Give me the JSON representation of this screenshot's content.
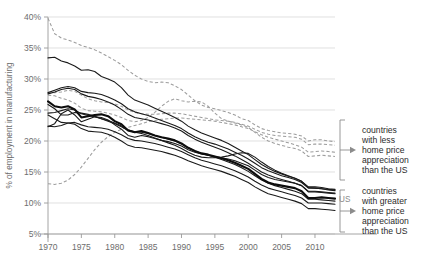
{
  "chart_data": {
    "type": "line",
    "title": "",
    "xlabel": "",
    "ylabel": "% of employment in manufacturing",
    "xlim": [
      1970,
      2013
    ],
    "ylim": [
      5,
      40
    ],
    "grid": true,
    "legend_position": "right-annotations",
    "x_ticks": [
      "1970",
      "1975",
      "1980",
      "1985",
      "1990",
      "1995",
      "2000",
      "2005",
      "2010"
    ],
    "x_tick_values": [
      1970,
      1975,
      1980,
      1985,
      1990,
      1995,
      2000,
      2005,
      2010
    ],
    "y_ticks": [
      "5%",
      "10%",
      "15%",
      "20%",
      "25%",
      "30%",
      "35%",
      "40%"
    ],
    "y_tick_values": [
      5,
      10,
      15,
      20,
      25,
      30,
      35,
      40
    ],
    "x": [
      1970,
      1971,
      1972,
      1973,
      1974,
      1975,
      1976,
      1977,
      1978,
      1979,
      1980,
      1981,
      1982,
      1983,
      1984,
      1985,
      1986,
      1987,
      1988,
      1989,
      1990,
      1991,
      1992,
      1993,
      1994,
      1995,
      1996,
      1997,
      1998,
      1999,
      2000,
      2001,
      2002,
      2003,
      2004,
      2005,
      2006,
      2007,
      2008,
      2009,
      2010,
      2011,
      2012,
      2013
    ],
    "series": [
      {
        "name": "dashed-1",
        "style": "dashed",
        "group": "less_appreciation",
        "values": [
          39.8,
          37.3,
          36.6,
          36.3,
          35.9,
          35.4,
          35.1,
          34.7,
          34.2,
          33.6,
          33.0,
          32.3,
          31.4,
          30.6,
          30.0,
          29.6,
          29.4,
          29.5,
          29.4,
          28.9,
          28.3,
          27.4,
          26.5,
          25.8,
          25.4,
          25.2,
          24.9,
          24.6,
          24.2,
          23.6,
          23.3,
          22.6,
          22.0,
          21.7,
          21.5,
          21.3,
          21.2,
          21.1,
          20.8,
          20.0,
          20.2,
          20.2,
          20.0,
          19.9
        ]
      },
      {
        "name": "dashed-2",
        "style": "dashed",
        "group": "less_appreciation",
        "values": [
          27.7,
          27.8,
          27.9,
          28.2,
          28.0,
          27.4,
          26.8,
          26.5,
          26.3,
          26.2,
          26.0,
          25.6,
          25.0,
          24.6,
          24.4,
          24.3,
          24.3,
          24.4,
          24.5,
          24.5,
          24.4,
          24.2,
          24.0,
          23.8,
          23.6,
          23.4,
          23.3,
          23.2,
          23.0,
          22.7,
          22.4,
          21.9,
          21.4,
          21.1,
          20.9,
          20.8,
          20.7,
          20.6,
          20.3,
          19.4,
          19.5,
          19.5,
          19.4,
          19.3
        ]
      },
      {
        "name": "dashed-3",
        "style": "dashed",
        "group": "less_appreciation",
        "values": [
          27.4,
          27.3,
          26.9,
          26.6,
          26.1,
          25.3,
          24.9,
          24.8,
          24.7,
          24.5,
          24.2,
          23.8,
          23.3,
          23.1,
          23.3,
          23.8,
          24.6,
          25.6,
          26.4,
          26.8,
          26.5,
          26.3,
          26.4,
          26.3,
          25.6,
          24.5,
          23.6,
          23.2,
          22.9,
          22.6,
          22.2,
          21.4,
          20.6,
          20.0,
          19.6,
          19.3,
          19.0,
          18.8,
          18.4,
          17.5,
          17.6,
          17.7,
          17.6,
          17.5
        ]
      },
      {
        "name": "dashed-4",
        "style": "dashed",
        "group": "less_appreciation",
        "values": [
          13.1,
          13.0,
          13.2,
          13.7,
          14.6,
          15.8,
          17.2,
          18.6,
          19.8,
          20.7,
          21.4,
          21.9,
          22.2,
          22.5,
          22.8,
          23.1,
          23.3,
          23.5,
          23.6,
          23.7,
          23.7,
          23.6,
          23.5,
          23.4,
          23.3,
          23.2,
          23.0,
          22.8,
          22.6,
          22.3,
          22.0,
          21.5,
          21.0,
          20.6,
          20.3,
          20.0,
          19.7,
          19.4,
          19.0,
          18.2,
          18.3,
          18.4,
          18.3,
          18.2
        ]
      },
      {
        "name": "solid-1",
        "style": "solid",
        "group": "greater_appreciation",
        "values": [
          33.4,
          33.5,
          32.9,
          32.6,
          32.1,
          31.4,
          31.5,
          31.2,
          30.4,
          30.0,
          29.5,
          28.6,
          27.4,
          26.6,
          26.2,
          25.8,
          25.3,
          24.8,
          24.3,
          23.8,
          23.2,
          22.4,
          21.8,
          21.3,
          20.9,
          20.5,
          20.1,
          19.6,
          19.0,
          18.4,
          17.8,
          17.0,
          16.2,
          15.6,
          15.1,
          14.7,
          14.3,
          14.0,
          13.5,
          12.6,
          12.6,
          12.5,
          12.3,
          12.2
        ]
      },
      {
        "name": "solid-2",
        "style": "solid",
        "group": "greater_appreciation",
        "values": [
          27.8,
          28.2,
          28.6,
          28.8,
          28.6,
          28.0,
          27.8,
          27.7,
          27.5,
          27.1,
          26.6,
          26.0,
          25.2,
          24.7,
          24.4,
          24.1,
          23.7,
          23.3,
          22.9,
          22.5,
          22.0,
          21.3,
          20.7,
          20.2,
          19.8,
          19.5,
          19.1,
          18.7,
          18.2,
          17.7,
          17.1,
          16.4,
          15.7,
          15.2,
          14.8,
          14.4,
          14.1,
          13.8,
          13.3,
          12.4,
          12.4,
          12.3,
          12.1,
          12.0
        ]
      },
      {
        "name": "solid-3",
        "style": "solid",
        "group": "greater_appreciation",
        "values": [
          27.6,
          27.9,
          28.3,
          28.5,
          28.3,
          27.6,
          27.2,
          27.0,
          26.7,
          26.3,
          25.8,
          25.1,
          24.3,
          23.8,
          23.6,
          23.4,
          23.1,
          22.8,
          22.5,
          22.1,
          21.6,
          20.9,
          20.3,
          19.8,
          19.4,
          19.0,
          18.6,
          18.1,
          17.6,
          17.0,
          16.4,
          15.7,
          15.0,
          14.5,
          14.1,
          13.8,
          13.5,
          13.2,
          12.8,
          11.9,
          11.9,
          11.8,
          11.7,
          11.6
        ]
      },
      {
        "name": "solid-4-us",
        "style": "solid-bold",
        "group": "greater_appreciation",
        "label": "US",
        "values": [
          26.4,
          25.6,
          25.4,
          25.6,
          25.1,
          23.8,
          24.0,
          24.2,
          24.3,
          24.0,
          23.2,
          22.7,
          21.7,
          21.4,
          21.6,
          21.3,
          20.9,
          20.6,
          20.4,
          20.1,
          19.6,
          18.9,
          18.4,
          18.0,
          17.8,
          17.5,
          17.2,
          16.9,
          16.5,
          16.0,
          15.5,
          14.7,
          13.9,
          13.3,
          13.0,
          12.8,
          12.6,
          12.4,
          11.9,
          10.8,
          10.8,
          10.9,
          10.8,
          10.7
        ]
      },
      {
        "name": "solid-5",
        "style": "solid",
        "group": "greater_appreciation",
        "values": [
          24.5,
          24.6,
          24.9,
          25.2,
          25.0,
          24.4,
          24.1,
          23.9,
          23.6,
          23.3,
          22.9,
          22.4,
          21.8,
          21.5,
          21.4,
          21.2,
          20.9,
          20.6,
          20.3,
          20.0,
          19.5,
          18.9,
          18.4,
          18.0,
          17.7,
          17.4,
          17.0,
          16.6,
          16.2,
          15.7,
          15.1,
          14.4,
          13.7,
          13.2,
          12.8,
          12.5,
          12.2,
          11.9,
          11.5,
          10.6,
          10.6,
          10.5,
          10.4,
          10.3
        ]
      },
      {
        "name": "solid-6",
        "style": "solid",
        "group": "greater_appreciation",
        "values": [
          22.4,
          22.3,
          22.5,
          22.9,
          23.0,
          22.6,
          22.3,
          22.2,
          22.1,
          21.9,
          21.5,
          21.0,
          20.4,
          20.1,
          20.0,
          19.8,
          19.6,
          19.3,
          19.0,
          18.7,
          18.3,
          17.8,
          17.3,
          16.9,
          16.6,
          16.3,
          16.0,
          15.6,
          15.2,
          14.7,
          14.2,
          13.5,
          12.9,
          12.4,
          12.1,
          11.8,
          11.5,
          11.2,
          10.8,
          10.0,
          10.0,
          10.0,
          9.9,
          9.8
        ]
      },
      {
        "name": "solid-7",
        "style": "solid",
        "group": "greater_appreciation",
        "values": [
          24.2,
          23.6,
          23.0,
          22.9,
          22.7,
          22.0,
          21.6,
          21.5,
          21.4,
          21.1,
          20.6,
          20.0,
          19.3,
          19.0,
          18.9,
          18.7,
          18.5,
          18.3,
          18.0,
          17.7,
          17.3,
          16.8,
          16.4,
          16.0,
          15.7,
          15.4,
          15.1,
          14.7,
          14.3,
          13.8,
          13.3,
          12.6,
          12.0,
          11.5,
          11.2,
          10.9,
          10.6,
          10.3,
          9.9,
          9.1,
          9.1,
          9.0,
          8.9,
          8.8
        ]
      },
      {
        "name": "solid-8",
        "style": "solid",
        "group": "greater_appreciation",
        "values": [
          22.3,
          22.8,
          24.4,
          25.0,
          24.2,
          23.1,
          23.5,
          23.9,
          23.8,
          23.4,
          22.6,
          21.9,
          20.9,
          20.6,
          20.9,
          20.7,
          20.4,
          20.1,
          19.9,
          19.6,
          19.2,
          18.6,
          18.2,
          17.9,
          17.7,
          17.5,
          17.3,
          17.1,
          16.8,
          16.4,
          16.0,
          15.3,
          14.6,
          14.1,
          13.8,
          13.6,
          13.4,
          13.2,
          12.8,
          11.8,
          11.8,
          11.7,
          11.6,
          11.5
        ]
      },
      {
        "name": "solid-9",
        "style": "solid",
        "group": "greater_appreciation",
        "values": [
          25.9,
          25.2,
          24.2,
          24.2,
          24.6,
          24.5,
          24.3,
          24.0,
          23.6,
          23.2,
          22.8,
          22.3,
          21.7,
          21.4,
          21.2,
          20.9,
          20.5,
          20.1,
          19.7,
          19.3,
          18.8,
          18.2,
          17.7,
          17.4,
          17.3,
          17.3,
          17.4,
          17.6,
          17.9,
          18.1,
          18.0,
          17.4,
          16.6,
          15.9,
          15.3,
          14.8,
          14.4,
          14.0,
          13.5,
          12.5,
          12.4,
          12.3,
          12.2,
          12.1
        ]
      }
    ]
  },
  "annotations": {
    "upper": {
      "lines": [
        "countries",
        "with less",
        "home price",
        "appreciation",
        "than the US"
      ]
    },
    "lower": {
      "lines": [
        "countries",
        "with greater",
        "home price",
        "appreciation",
        "than the US"
      ]
    },
    "us_marker": "US"
  },
  "colors": {
    "solid_line": "#1a1a1a",
    "dashed_line": "#9d9d9d",
    "grid": "#d2d2d2",
    "axis": "#9a9a9a",
    "tick_text": "#6d6d6d",
    "annotation_text": "#2b2b2b",
    "background": "#ffffff"
  }
}
